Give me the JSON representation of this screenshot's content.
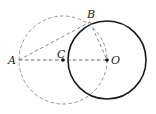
{
  "diagram": {
    "title": "",
    "points": {
      "A": {
        "label": "A",
        "x": 19,
        "y": 60
      },
      "B": {
        "label": "B",
        "x": 90,
        "y": 22
      },
      "C": {
        "label": "C",
        "x": 63,
        "y": 60
      },
      "O": {
        "label": "O",
        "x": 107,
        "y": 60
      }
    },
    "circles": [
      {
        "name": "circle-O",
        "center": "O",
        "r": 39,
        "style": "solid",
        "color": "#1a1a1a"
      },
      {
        "name": "circle-C",
        "center": "C",
        "r": 44,
        "style": "dashed",
        "color": "#888888"
      }
    ],
    "segments": [
      {
        "from": "A",
        "to": "O",
        "style": "dashed"
      },
      {
        "from": "A",
        "to": "B",
        "style": "dashed"
      },
      {
        "from": "B",
        "to": "O",
        "style": "dashed"
      }
    ]
  }
}
